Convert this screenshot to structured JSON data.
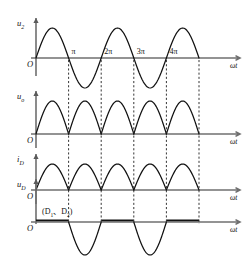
{
  "figure": {
    "type": "waveform-timing-diagram",
    "width": 250,
    "height": 264,
    "background_color": "#ffffff",
    "curve_color": "#111111",
    "axis_color": "#6f6f6f",
    "dash_color": "#2a2a2a"
  },
  "geometry": {
    "origin_x": 36,
    "axis_end_x": 232,
    "arrow_x": 240,
    "pi_step": 32.6,
    "periods": 5
  },
  "tick_labels": [
    "π",
    "2π",
    "3π",
    "4π"
  ],
  "dashed_at": [
    "π",
    "2π",
    "3π",
    "4π",
    "5π"
  ],
  "panels": [
    {
      "id": "u2",
      "y_label": "u",
      "y_sub": "2",
      "origin_label": "O",
      "x_label": "ωt",
      "baseline_y": 58,
      "amplitude": 30,
      "shape": "full-sine",
      "show_ticks": true
    },
    {
      "id": "uo",
      "y_label": "u",
      "y_sub": "o",
      "origin_label": "O",
      "x_label": "ωt",
      "baseline_y": 134,
      "amplitude": 33,
      "shape": "full-wave-rectified",
      "show_ticks": false
    },
    {
      "id": "iD",
      "y_label": "i",
      "y_sub": "D",
      "origin_label": "O",
      "x_label": "ωt",
      "baseline_y": 190,
      "amplitude": 26,
      "shape": "full-wave-rectified",
      "show_ticks": false
    },
    {
      "id": "uD",
      "y_label": "u",
      "y_sub": "D",
      "origin_label": "O",
      "x_label": "ωt",
      "baseline_y": 222,
      "amplitude": 33,
      "shape": "negative-alternating-humps",
      "annotation": "(D₁、D₂)",
      "annotation_parts": {
        "open": "(D",
        "sub1": "1",
        "sep": "、",
        "mid": "D",
        "sub2": "2",
        "close": ")"
      },
      "show_ticks": false
    }
  ],
  "chart_data": {
    "type": "line",
    "title": "",
    "xlabel": "ωt",
    "ylabel": "",
    "x_ticks": [
      "π",
      "2π",
      "3π",
      "4π"
    ],
    "x_range": [
      0,
      15.707
    ],
    "grid": false,
    "legend": "none",
    "series": [
      {
        "name": "u2",
        "label": "u₂",
        "description": "Transformer secondary voltage: sin(x), full sine over 0..5π",
        "formula": "sin(x)",
        "ylim": [
          -1,
          1
        ]
      },
      {
        "name": "uo",
        "label": "uₒ",
        "description": "Output voltage: |sin(x)|, full-wave rectified",
        "formula": "abs(sin(x))",
        "ylim": [
          0,
          1
        ]
      },
      {
        "name": "iD",
        "label": "iD",
        "description": "Diode current: |sin(x)|, full-wave rectified",
        "formula": "abs(sin(x))",
        "ylim": [
          0,
          1
        ]
      },
      {
        "name": "uD",
        "label": "uD",
        "description": "Diode reverse voltage: 0 on 0..π, -sin over π..2π, repeating",
        "formula": "min(0, -sin(x)) pattern with flat zero half-cycles",
        "ylim": [
          -1,
          0
        ]
      }
    ]
  }
}
